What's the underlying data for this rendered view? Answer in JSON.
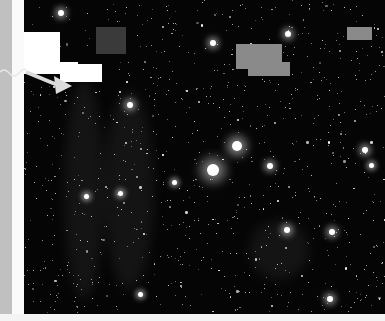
{
  "image": {
    "subject": "astronomical star field with faint nebular filaments",
    "colors": {
      "background": "#050505",
      "left_bar": "#c0c0c0",
      "left_strip": "#fafafa",
      "occluder_white": "#ffffff",
      "occluder_dark": "#3a3a3a",
      "occluder_gray": "#8a8a8a"
    }
  },
  "overlays": {
    "white_block_1": {
      "x": 24,
      "y": 32,
      "w": 36,
      "h": 32
    },
    "white_block_2": {
      "x": 24,
      "y": 62,
      "w": 54,
      "h": 12
    },
    "white_block_3": {
      "x": 60,
      "y": 64,
      "w": 42,
      "h": 18
    },
    "dark_block": {
      "x": 96,
      "y": 27,
      "w": 30,
      "h": 27
    },
    "gray_block_1": {
      "x": 236,
      "y": 44,
      "w": 46,
      "h": 25
    },
    "gray_block_2": {
      "x": 248,
      "y": 62,
      "w": 42,
      "h": 14
    },
    "gray_block_3": {
      "x": 347,
      "y": 27,
      "w": 25,
      "h": 13
    }
  },
  "bright_stars": [
    {
      "x": 213,
      "y": 170,
      "r": 6
    },
    {
      "x": 237,
      "y": 146,
      "r": 5
    },
    {
      "x": 270,
      "y": 166,
      "r": 3
    },
    {
      "x": 61,
      "y": 13,
      "r": 3
    },
    {
      "x": 287,
      "y": 230,
      "r": 3
    },
    {
      "x": 130,
      "y": 105,
      "r": 3
    },
    {
      "x": 213,
      "y": 43,
      "r": 3
    },
    {
      "x": 288,
      "y": 34,
      "r": 3
    },
    {
      "x": 332,
      "y": 232,
      "r": 3
    },
    {
      "x": 86,
      "y": 196,
      "r": 2.5
    },
    {
      "x": 120,
      "y": 193,
      "r": 2.5
    },
    {
      "x": 174,
      "y": 182,
      "r": 2.5
    },
    {
      "x": 140,
      "y": 294,
      "r": 2.5
    },
    {
      "x": 330,
      "y": 299,
      "r": 3
    },
    {
      "x": 365,
      "y": 150,
      "r": 3
    },
    {
      "x": 371,
      "y": 165,
      "r": 2.5
    }
  ]
}
